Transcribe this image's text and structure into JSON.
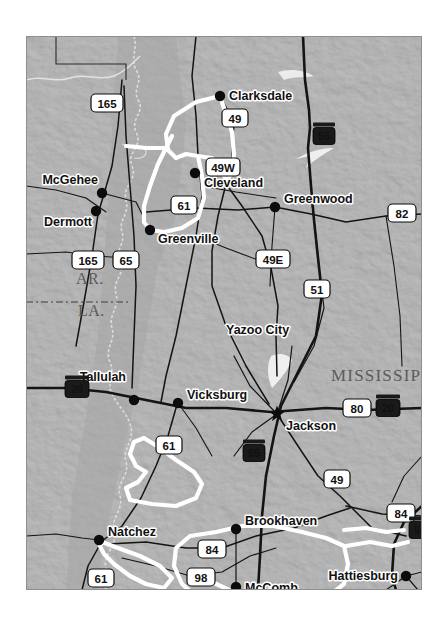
{
  "figure": {
    "page_background": "#ffffff",
    "map_background": "#9a9a9a",
    "map_bounds": {
      "x": 26,
      "y": 36,
      "width": 396,
      "height": 554
    }
  },
  "colors": {
    "terrain": "#9a9a9a",
    "terrain_light": "#aeaeae",
    "terrain_dark": "#868686",
    "road": "#1a1a1a",
    "corridor_highlight": "#ffffff",
    "river": "#d8d8d8",
    "state_label": "#5b5b5b",
    "city_label": "#111111",
    "shield_us_fill": "#ffffff",
    "shield_us_text": "#000000",
    "shield_interstate_fill": "#1a1a1a",
    "shield_interstate_text": "#ffffff"
  },
  "state_labels": [
    {
      "name": "AR.",
      "x": 50,
      "y": 248,
      "size": 16
    },
    {
      "name": "LA.",
      "x": 52,
      "y": 280,
      "size": 16
    },
    {
      "name": "MISSISSIPPI",
      "x": 305,
      "y": 345,
      "size": 17
    }
  ],
  "cities": [
    {
      "name": "Clarksdale",
      "x": 194,
      "y": 60,
      "label_x": 203,
      "label_y": 64,
      "marker": "dot",
      "anchor": "start"
    },
    {
      "name": "Cleveland",
      "x": 169,
      "y": 137,
      "label_x": 178,
      "label_y": 151,
      "marker": "dot",
      "anchor": "start"
    },
    {
      "name": "Greenwood",
      "x": 249,
      "y": 171,
      "label_x": 258,
      "label_y": 167,
      "marker": "dot",
      "anchor": "start"
    },
    {
      "name": "McGehee",
      "x": 76,
      "y": 157,
      "label_x": 72,
      "label_y": 148,
      "marker": "dot",
      "anchor": "end"
    },
    {
      "name": "Dermott",
      "x": 70,
      "y": 175,
      "label_x": 66,
      "label_y": 190,
      "marker": "dot",
      "anchor": "end"
    },
    {
      "name": "Greenville",
      "x": 124,
      "y": 194,
      "label_x": 132,
      "label_y": 207,
      "marker": "dot",
      "anchor": "start"
    },
    {
      "name": "Yazoo City",
      "x": 108,
      "y": 294,
      "label_x": 200,
      "label_y": 298,
      "marker": "none",
      "anchor": "start"
    },
    {
      "name": "Tallulah",
      "x": 108,
      "y": 364,
      "label_x": 100,
      "label_y": 345,
      "marker": "dot",
      "anchor": "end"
    },
    {
      "name": "Vicksburg",
      "x": 152,
      "y": 367,
      "label_x": 161,
      "label_y": 363,
      "marker": "dot",
      "anchor": "start"
    },
    {
      "name": "Jackson",
      "x": 251,
      "y": 378,
      "label_x": 260,
      "label_y": 394,
      "marker": "star",
      "anchor": "start"
    },
    {
      "name": "Brookhaven",
      "x": 210,
      "y": 493,
      "label_x": 219,
      "label_y": 489,
      "marker": "dot",
      "anchor": "start"
    },
    {
      "name": "Natchez",
      "x": 73,
      "y": 504,
      "label_x": 82,
      "label_y": 500,
      "marker": "dot",
      "anchor": "start"
    },
    {
      "name": "McComb",
      "x": 210,
      "y": 551,
      "label_x": 219,
      "label_y": 556,
      "marker": "dot",
      "anchor": "start"
    },
    {
      "name": "Hattiesburg",
      "x": 380,
      "y": 540,
      "label_x": 372,
      "label_y": 544,
      "marker": "dot",
      "anchor": "end"
    }
  ],
  "shields": [
    {
      "number": "165",
      "type": "us",
      "x": 81,
      "y": 67,
      "w": 32,
      "h": 18
    },
    {
      "number": "49",
      "type": "us",
      "x": 209,
      "y": 82,
      "w": 26,
      "h": 18
    },
    {
      "number": "49W",
      "type": "us",
      "x": 197,
      "y": 131,
      "w": 34,
      "h": 18
    },
    {
      "number": "61",
      "type": "us",
      "x": 158,
      "y": 169,
      "w": 26,
      "h": 18
    },
    {
      "number": "55",
      "type": "interstate",
      "x": 298,
      "y": 100,
      "w": 22,
      "h": 17
    },
    {
      "number": "82",
      "type": "us",
      "x": 376,
      "y": 177,
      "w": 28,
      "h": 18
    },
    {
      "number": "165",
      "type": "us",
      "x": 62,
      "y": 224,
      "w": 32,
      "h": 18
    },
    {
      "number": "65",
      "type": "us",
      "x": 100,
      "y": 224,
      "w": 26,
      "h": 18
    },
    {
      "number": "49E",
      "type": "us",
      "x": 247,
      "y": 223,
      "w": 34,
      "h": 18
    },
    {
      "number": "51",
      "type": "us",
      "x": 291,
      "y": 253,
      "w": 26,
      "h": 18
    },
    {
      "number": "20",
      "type": "interstate",
      "x": 51,
      "y": 353,
      "w": 24,
      "h": 17
    },
    {
      "number": "80",
      "type": "us",
      "x": 331,
      "y": 372,
      "w": 28,
      "h": 18
    },
    {
      "number": "20",
      "type": "interstate",
      "x": 362,
      "y": 372,
      "w": 24,
      "h": 17
    },
    {
      "number": "61",
      "type": "us",
      "x": 143,
      "y": 409,
      "w": 26,
      "h": 18
    },
    {
      "number": "55",
      "type": "interstate",
      "x": 228,
      "y": 417,
      "w": 22,
      "h": 17
    },
    {
      "number": "49",
      "type": "us",
      "x": 311,
      "y": 443,
      "w": 26,
      "h": 18
    },
    {
      "number": "84",
      "type": "us",
      "x": 375,
      "y": 477,
      "w": 28,
      "h": 18
    },
    {
      "number": "59",
      "type": "interstate",
      "x": 394,
      "y": 494,
      "w": 22,
      "h": 17
    },
    {
      "number": "84",
      "type": "us",
      "x": 186,
      "y": 513,
      "w": 28,
      "h": 18
    },
    {
      "number": "61",
      "type": "us",
      "x": 75,
      "y": 542,
      "w": 26,
      "h": 18
    },
    {
      "number": "98",
      "type": "us",
      "x": 175,
      "y": 541,
      "w": 28,
      "h": 18
    }
  ],
  "corridors": [
    {
      "name": "delta-greenville-clarksdale-loop"
    },
    {
      "name": "natchez-north-loop"
    },
    {
      "name": "natchez-south-loop"
    },
    {
      "name": "brookhaven-hattiesburg-loop"
    },
    {
      "name": "hattiesburg-east-spur"
    }
  ],
  "rivers": [
    {
      "name": "mississippi-river"
    },
    {
      "name": "arkansas-tributary"
    },
    {
      "name": "yazoo-white-mark"
    },
    {
      "name": "jackson-reservoir"
    }
  ]
}
